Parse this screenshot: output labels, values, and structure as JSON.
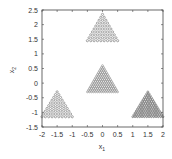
{
  "chart_data": {
    "type": "scatter",
    "title": "",
    "xlabel": "x_1",
    "ylabel": "x_2",
    "xlim": [
      -2,
      2
    ],
    "ylim": [
      -1.5,
      2.5
    ],
    "xticks": [
      -2,
      -1.5,
      -1,
      -0.5,
      0,
      0.5,
      1,
      1.5,
      2
    ],
    "yticks": [
      -1.5,
      -1,
      -0.5,
      0,
      0.5,
      1,
      1.5,
      2,
      2.5
    ],
    "xtick_labels": [
      "-2",
      "-1.5",
      "-1",
      "-0.5",
      "0",
      "0.5",
      "1",
      "1.5",
      "2"
    ],
    "ytick_labels": [
      "-1.5",
      "-1",
      "-0.5",
      "0",
      "0.5",
      "1",
      "1.5",
      "2",
      "2.5"
    ],
    "grid": false,
    "legend": null,
    "marker": "small circle",
    "series": [
      {
        "name": "top triangle",
        "shape": "triangle",
        "x_range": [
          -0.5,
          0.5
        ],
        "y_range": [
          1.45,
          2.35
        ],
        "apex": [
          0,
          2.35
        ],
        "rows": 10,
        "density": "medium",
        "color": "#555555"
      },
      {
        "name": "center triangle",
        "shape": "triangle",
        "x_range": [
          -0.5,
          0.5
        ],
        "y_range": [
          -0.3,
          0.6
        ],
        "apex": [
          0,
          0.6
        ],
        "rows": 16,
        "density": "high",
        "color": "#777777"
      },
      {
        "name": "bottom-left triangle",
        "shape": "triangle",
        "x_range": [
          -2.0,
          -1.0
        ],
        "y_range": [
          -1.15,
          -0.3
        ],
        "apex": [
          -1.5,
          -0.3
        ],
        "rows": 10,
        "density": "medium",
        "color": "#555555"
      },
      {
        "name": "bottom-right triangle",
        "shape": "triangle",
        "x_range": [
          1.0,
          2.0
        ],
        "y_range": [
          -1.15,
          -0.3
        ],
        "apex": [
          1.5,
          -0.3
        ],
        "rows": 14,
        "density": "high",
        "color": "#333333"
      }
    ]
  }
}
